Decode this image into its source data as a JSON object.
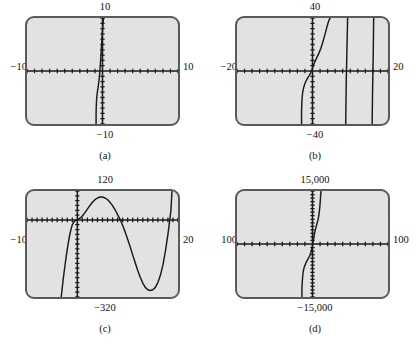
{
  "figure": {
    "background_color": "#ffffff",
    "screen_color": "#e2e2e2",
    "screen_border_color": "#5a5a5a",
    "curve_color": "#1a1a1a"
  },
  "chart_data": [
    {
      "id": "a",
      "type": "line",
      "caption": "(a)",
      "title": "",
      "xlabel": "",
      "ylabel": "",
      "xlim": [
        -10,
        10
      ],
      "ylim": [
        -10,
        10
      ],
      "label_top": "10",
      "label_bottom": "−10",
      "label_left": "−10",
      "label_right": "10",
      "grid": false,
      "legend": "none",
      "tick_spacing_x": 1,
      "tick_spacing_y": 1,
      "description": "A very steep, nearly vertical increasing curve just left of the y-axis; rises off the top of the window near x = 0 and drops off the bottom of the window near x = -0.6.",
      "x": [
        -0.85,
        -0.85,
        -0.84,
        -0.82,
        -0.8,
        -0.78,
        -0.76,
        -0.74,
        -0.72,
        -0.7,
        -0.66,
        -0.62,
        -0.58,
        -0.54,
        -0.5,
        -0.46,
        -0.42,
        -0.38,
        -0.34,
        -0.3,
        -0.26,
        -0.22,
        -0.18,
        -0.14,
        -0.1,
        -0.06,
        -0.02,
        0.02,
        0.06,
        0.1,
        0.14,
        0.18
      ],
      "y": [
        -10.0,
        -8.6,
        -7.4,
        -6.5,
        -5.9,
        -5.4,
        -5.0,
        -4.7,
        -4.4,
        -4.2,
        -3.8,
        -3.4,
        -3.0,
        -2.6,
        -2.2,
        -1.7,
        -1.2,
        -0.6,
        0.1,
        0.9,
        1.8,
        2.7,
        3.6,
        4.5,
        5.4,
        6.3,
        7.2,
        8.1,
        9.0,
        9.6,
        9.9,
        10.0
      ]
    },
    {
      "id": "b",
      "type": "line",
      "caption": "(b)",
      "title": "",
      "xlabel": "",
      "ylabel": "",
      "xlim": [
        -20,
        20
      ],
      "ylim": [
        -40,
        40
      ],
      "label_top": "40",
      "label_bottom": "−40",
      "label_left": "−20",
      "label_right": "20",
      "grid": false,
      "legend": "none",
      "tick_spacing_x": 2,
      "tick_spacing_y": 4,
      "description": "A tangent-like function with three nearly vertical branches: one steep S-shaped increasing branch crossing the origin, plus two almost-vertical asymptote branches near x = 9 and x = 16.",
      "series": [
        {
          "name": "main-branch",
          "x": [
            -2.9,
            -2.9,
            -2.8,
            -2.6,
            -2.3,
            -2.0,
            -1.7,
            -1.4,
            -1.1,
            -0.8,
            -0.5,
            -0.2,
            0.1,
            0.4,
            0.8,
            1.2,
            1.7,
            2.2,
            2.7,
            3.2,
            3.7,
            4.1,
            4.4,
            4.6,
            4.7
          ],
          "y": [
            -40,
            -30,
            -22,
            -16,
            -12,
            -9.5,
            -7.5,
            -6.0,
            -4.5,
            -3.0,
            -1.5,
            0.5,
            3.0,
            5.5,
            8.0,
            10.5,
            13.5,
            17.0,
            21.5,
            26.5,
            32.0,
            36.0,
            38.5,
            39.6,
            40.0
          ]
        },
        {
          "name": "asymptote-branch-1",
          "x": [
            9.3,
            9.2,
            9.1,
            9.05,
            9.0,
            8.95,
            8.9,
            8.85,
            8.8
          ],
          "y": [
            40,
            26,
            14,
            6,
            0,
            -7,
            -16,
            -28,
            -40
          ]
        },
        {
          "name": "asymptote-branch-2",
          "x": [
            16.2,
            16.15,
            16.1,
            16.05,
            16.0,
            15.95,
            15.9,
            15.85,
            15.8
          ],
          "y": [
            40,
            27,
            15,
            6,
            0,
            -8,
            -18,
            -29,
            -40
          ]
        }
      ]
    },
    {
      "id": "c",
      "type": "line",
      "caption": "(c)",
      "title": "",
      "xlabel": "",
      "ylabel": "",
      "xlim": [
        -10,
        20
      ],
      "ylim": [
        -320,
        120
      ],
      "label_top": "120",
      "label_bottom": "−320",
      "label_left": "−10",
      "label_right": "20",
      "grid": false,
      "legend": "none",
      "tick_spacing_x": 1,
      "tick_spacing_y": 20,
      "description": "A quartic-like polynomial: rises steeply from the bottom left, crosses the x-axis near x = -1.5, flattens near the origin, rises to a local maximum of about 95 near x = 4.5, falls through the x-axis near x = 9 to a local minimum of about -290 near x = 15.5, then rises steeply off the top right near x = 18.5.",
      "x": [
        -3.2,
        -3.0,
        -2.8,
        -2.6,
        -2.4,
        -2.2,
        -2.0,
        -1.8,
        -1.6,
        -1.4,
        -1.2,
        -1.0,
        -0.6,
        -0.2,
        0.2,
        0.6,
        1.0,
        1.5,
        2.0,
        2.5,
        3.0,
        3.5,
        4.0,
        4.5,
        5.0,
        5.5,
        6.0,
        6.5,
        7.0,
        7.5,
        8.0,
        8.5,
        9.0,
        9.5,
        10.0,
        10.5,
        11.0,
        11.5,
        12.0,
        12.5,
        13.0,
        13.5,
        14.0,
        14.5,
        15.0,
        15.5,
        16.0,
        16.5,
        17.0,
        17.5,
        18.0,
        18.3,
        18.6,
        18.8
      ],
      "y": [
        -320,
        -282,
        -246,
        -212,
        -180,
        -150,
        -122,
        -96,
        -72,
        -52,
        -34,
        -20,
        -6,
        0,
        3,
        8,
        16,
        30,
        45,
        60,
        73,
        84,
        91,
        95,
        95,
        91,
        84,
        73,
        59,
        42,
        22,
        2,
        -22,
        -50,
        -80,
        -112,
        -145,
        -178,
        -210,
        -238,
        -262,
        -280,
        -290,
        -293,
        -290,
        -280,
        -260,
        -230,
        -188,
        -130,
        -60,
        -10,
        40,
        120
      ]
    },
    {
      "id": "d",
      "type": "line",
      "caption": "(d)",
      "title": "",
      "xlabel": "",
      "ylabel": "",
      "xlim": [
        -100,
        100
      ],
      "ylim": [
        -15000,
        15000
      ],
      "label_top": "15,000",
      "label_bottom": "−15,000",
      "label_left": "100",
      "label_right": "100",
      "grid": false,
      "legend": "none",
      "tick_spacing_x": 10,
      "tick_spacing_y": 1000,
      "description": "A very steep increasing curve crossing the x-axis slightly right of the origin; it plunges off the bottom of the window near x = -12 and shoots off the top of the window near x = 11.",
      "x": [
        -14,
        -14,
        -13.5,
        -13,
        -12.5,
        -12,
        -11,
        -10,
        -9,
        -8,
        -7,
        -6,
        -5,
        -4,
        -3,
        -2,
        -1,
        0,
        1,
        2,
        3,
        4,
        5,
        6,
        7,
        8,
        9,
        10,
        10.5,
        11,
        11.5
      ],
      "y": [
        -15000,
        -12500,
        -10600,
        -9200,
        -8200,
        -7500,
        -6600,
        -6000,
        -5500,
        -5050,
        -4650,
        -4250,
        -3850,
        -3400,
        -2900,
        -2300,
        -1500,
        -500,
        900,
        2200,
        3300,
        4200,
        5000,
        5800,
        6600,
        7600,
        9000,
        11200,
        12800,
        14400,
        15000
      ]
    }
  ]
}
